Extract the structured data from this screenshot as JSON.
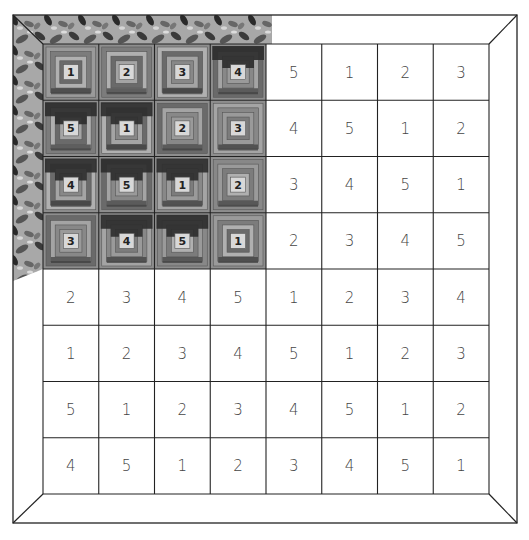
{
  "diagram": {
    "title": "",
    "grid": {
      "rows": 8,
      "cols": 8,
      "values": [
        [
          1,
          2,
          3,
          4,
          5,
          1,
          2,
          3
        ],
        [
          5,
          1,
          2,
          3,
          4,
          5,
          1,
          2
        ],
        [
          4,
          5,
          1,
          2,
          3,
          4,
          5,
          1
        ],
        [
          3,
          4,
          5,
          1,
          2,
          3,
          4,
          5
        ],
        [
          2,
          3,
          4,
          5,
          1,
          2,
          3,
          4
        ],
        [
          1,
          2,
          3,
          4,
          5,
          1,
          2,
          3
        ],
        [
          5,
          1,
          2,
          3,
          4,
          5,
          1,
          2
        ],
        [
          4,
          5,
          1,
          2,
          3,
          4,
          5,
          1
        ]
      ]
    },
    "pieced_section": {
      "label": "Completed log cabin blocks (top-left 4×4)",
      "rows": 4,
      "cols": 4,
      "block_labels": [
        [
          "1",
          "2",
          "3",
          "4"
        ],
        [
          "5",
          "1",
          "2",
          "3"
        ],
        [
          "4",
          "5",
          "1",
          "2"
        ],
        [
          "3",
          "4",
          "5",
          "1"
        ]
      ],
      "dark_block_positions": [
        [
          0,
          3
        ],
        [
          1,
          0
        ],
        [
          1,
          1
        ],
        [
          2,
          0
        ],
        [
          2,
          1
        ],
        [
          2,
          2
        ],
        [
          3,
          1
        ],
        [
          3,
          2
        ]
      ]
    },
    "border": {
      "style": "mitered",
      "pieced_portion": "printed fabric on top and left border beside finished blocks"
    },
    "colors": {
      "line": "#222222",
      "background": "#ffffff",
      "fabric_light": "#b5b5b5",
      "fabric_mid": "#8a8a8a",
      "fabric_dark": "#2e2e2e",
      "number_text": "#444444"
    }
  }
}
